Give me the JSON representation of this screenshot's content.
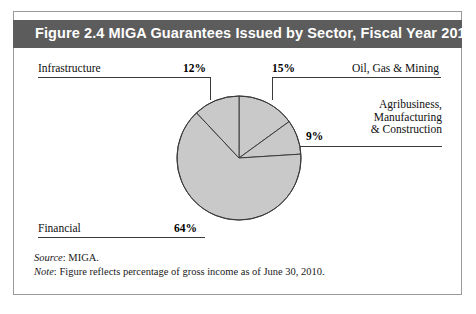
{
  "figure": {
    "title": "Figure 2.4  MIGA Guarantees Issued by Sector, Fiscal Year 2010",
    "title_bar_color": "#5c5c5c",
    "title_text_color": "#ffffff",
    "frame_color": "#9a9a9a",
    "background": "#ffffff"
  },
  "callouts": {
    "infrastructure": {
      "label": "Infrastructure",
      "percent": "12%"
    },
    "oil_gas_mining": {
      "label": "Oil, Gas & Mining",
      "percent": "15%"
    },
    "agribusiness": {
      "label_line1": "Agribusiness,",
      "label_line2": "Manufacturing",
      "label_line3": "& Construction",
      "percent": "9%"
    },
    "financial": {
      "label": "Financial",
      "percent": "64%"
    }
  },
  "footnotes": {
    "source_lead": "Source",
    "source_text": ": MIGA.",
    "note_lead": "Note",
    "note_text": ": Figure reflects percentage of gross income as of June 30, 2010."
  },
  "chart_data": {
    "type": "pie",
    "title": "Figure 2.4  MIGA Guarantees Issued by Sector, Fiscal Year 2010",
    "xlabel": "",
    "ylabel": "",
    "categories": [
      "Oil, Gas & Mining",
      "Agribusiness, Manufacturing & Construction",
      "Financial",
      "Infrastructure"
    ],
    "values": [
      15,
      9,
      64,
      12
    ],
    "value_labels": [
      "15%",
      "9%",
      "64%",
      "12%"
    ],
    "units": "percent of gross income",
    "start_angle_deg": 0,
    "direction": "clockwise",
    "slice_fill": "#c9c9c9",
    "slice_stroke": "#3a3a3a",
    "legend": "none",
    "grid": false,
    "annotations": [
      "Source: MIGA.",
      "Note: Figure reflects percentage of gross income as of June 30, 2010."
    ]
  }
}
